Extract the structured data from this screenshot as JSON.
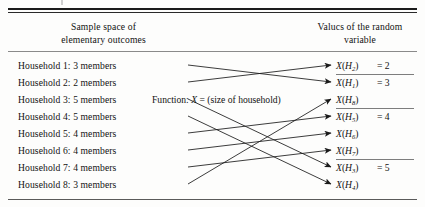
{
  "figure": {
    "type": "mapping-diagram",
    "headers": {
      "left": "Sample space of\nelementary outcomes",
      "left_line1": "Sample space of",
      "left_line2": "elementary outcomes",
      "right_line1": "Valucs of the random",
      "right_line2": "variable"
    },
    "function_label_pre": "Function: ",
    "function_label_var": "X",
    "function_label_post": " = (size of household)",
    "sample_space": [
      {
        "label": "Household 1: 3 members",
        "index": 1,
        "size": 3
      },
      {
        "label": "Household 2: 2 members",
        "index": 2,
        "size": 2
      },
      {
        "label": "Household 3: 5 members",
        "index": 3,
        "size": 5
      },
      {
        "label": "Household 4: 5 members",
        "index": 4,
        "size": 5
      },
      {
        "label": "Household 5: 4 members",
        "index": 5,
        "size": 4
      },
      {
        "label": "Household 6: 4 members",
        "index": 6,
        "size": 4
      },
      {
        "label": "Household 7: 4 members",
        "index": 7,
        "size": 4
      },
      {
        "label": "Household 8: 3 members",
        "index": 8,
        "size": 3
      }
    ],
    "values": [
      {
        "subscript": "2",
        "equals": "= 2"
      },
      {
        "subscript": "1",
        "equals": "= 3"
      },
      {
        "subscript": "8",
        "equals": ""
      },
      {
        "subscript": "5",
        "equals": "= 4"
      },
      {
        "subscript": "6",
        "equals": ""
      },
      {
        "subscript": "7",
        "equals": ""
      },
      {
        "subscript": "3",
        "equals": "= 5"
      },
      {
        "subscript": "4",
        "equals": ""
      }
    ],
    "value_var": "X",
    "value_open": "(",
    "value_H": "H",
    "value_close": ")",
    "mapping": [
      {
        "from": 1,
        "to_row": 2
      },
      {
        "from": 2,
        "to_row": 1
      },
      {
        "from": 3,
        "to_row": 7
      },
      {
        "from": 4,
        "to_row": 8
      },
      {
        "from": 5,
        "to_row": 4
      },
      {
        "from": 6,
        "to_row": 5
      },
      {
        "from": 7,
        "to_row": 6
      },
      {
        "from": 8,
        "to_row": 3
      }
    ],
    "group_rules_after_rows": [
      1,
      3,
      6
    ],
    "colors": {
      "ink": "#151515",
      "rule_heavy": "#1b1b1b",
      "rule_light": "#8a8a8a",
      "background": "#fdfdfc"
    }
  }
}
